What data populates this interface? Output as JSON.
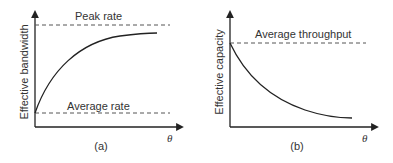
{
  "panels": [
    {
      "id": "a",
      "caption": "(a)",
      "y_axis_label": "Effective bandwidth",
      "x_axis_label": "θ",
      "upper_line_label": "Peak rate",
      "lower_line_label": "Average rate",
      "curve": "increasing, concave, from Average rate approaching Peak rate"
    },
    {
      "id": "b",
      "caption": "(b)",
      "y_axis_label": "Effective capacity",
      "x_axis_label": "θ",
      "upper_line_label": "Average throughput",
      "curve": "decreasing, convex, from Average throughput decaying toward a floor"
    }
  ],
  "colors": {
    "axis": "#222222",
    "dashed": "#555555",
    "text": "#333333",
    "background": "#ffffff"
  }
}
